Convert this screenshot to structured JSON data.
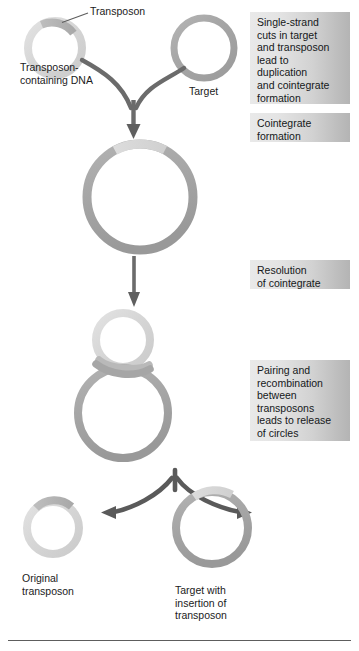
{
  "figure": {
    "title_kind": "transposon-cointegrate-pathway",
    "background_color": "#ffffff",
    "rule_color": "#5d5d5d"
  },
  "labels": {
    "transposon": "Transposon",
    "transposon_containing_dna": "Transposon-\ncontaining DNA",
    "target": "Target",
    "original_transposon": "Original\ntransposon",
    "target_with_insertion": "Target with\ninsertion of\ntransposon"
  },
  "notes": [
    {
      "id": "note-single-strand-cuts",
      "text": "Single-strand\ncuts in target\nand transposon\nlead to\nduplication\nand cointegrate\nformation"
    },
    {
      "id": "note-cointegrate-formation",
      "text": "Cointegrate\nformation"
    },
    {
      "id": "note-resolution-of-cointegrate",
      "text": "Resolution\nof cointegrate"
    },
    {
      "id": "note-pairing-and-recombination",
      "text": "Pairing and\nrecombination\nbetween\ntransposons\nleads to release\nof circles"
    }
  ],
  "colors": {
    "ring_light": "#d9d9d9",
    "ring_light_edge": "#c9c9c9",
    "ring_mid": "#b9b9b9",
    "ring_dark": "#9a9a9a",
    "ring_darker": "#8d8d8d",
    "transposon_segment": "#adadad",
    "arrow": "#6b6b6b",
    "arrow_dark": "#5a5a5a",
    "leader_line": "#5d5d5d",
    "note_bg_start": "#e9e9e9",
    "note_bg_end": "#b4b4b4",
    "text": "#15181a"
  },
  "shapes": {
    "donor_circle": {
      "name": "transposon-containing-dna-circle",
      "cx": 55,
      "cy": 48,
      "r": 27,
      "stroke": 8,
      "color": "#d8d8d8",
      "segment_color": "#b0b0b0",
      "segment_from_deg": -118,
      "segment_to_deg": -58
    },
    "target_circle": {
      "name": "target-circle",
      "cx": 204,
      "cy": 48,
      "r": 30,
      "stroke": 7,
      "color": "#a8a8a8"
    },
    "cointegrate_circle": {
      "name": "cointegrate-circle",
      "cx": 140,
      "cy": 197,
      "r": 53,
      "stroke": 9,
      "color": "#a9a9a9",
      "segment_color": "#d5d5d5",
      "segment_from_deg": -118,
      "segment_to_deg": -62
    },
    "figure8_small": {
      "name": "paired-transposon-small-circle",
      "cx": 123,
      "cy": 340,
      "r": 27,
      "stroke": 8,
      "color": "#d6d6d6"
    },
    "figure8_large": {
      "name": "paired-transposon-large-circle",
      "cx": 123,
      "cy": 413,
      "r": 45,
      "stroke": 8,
      "color": "#a9a9a9"
    },
    "product_transposon": {
      "name": "original-transposon-circle",
      "cx": 53,
      "cy": 528,
      "r": 26,
      "stroke": 8,
      "color": "#d8d8d8",
      "segment_color": "#b8b8b8",
      "segment_from_deg": -130,
      "segment_to_deg": -58
    },
    "product_target": {
      "name": "target-with-insertion-circle",
      "cx": 212,
      "cy": 528,
      "r": 36,
      "stroke": 8,
      "color": "#a6a6a6",
      "segment_color": "#c6c6c6",
      "segment_from_deg": -112,
      "segment_to_deg": -55
    }
  },
  "arrows": {
    "converge_top": {
      "name": "converging-arrow-to-cointegrate"
    },
    "down_to_figure8": {
      "name": "arrow-cointegrate-to-pairing"
    },
    "diverge_bottom": {
      "name": "diverging-arrow-to-products"
    }
  }
}
